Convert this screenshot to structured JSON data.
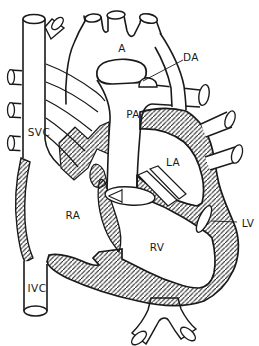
{
  "figure": {
    "background_color": "#ffffff",
    "line_color": "#1a1a1a",
    "labels": {
      "aorta": "A",
      "ductus_arteriosus": "DA",
      "pulmonary_artery": "PA",
      "superior_vena_cava": "SVC",
      "left_atrium": "LA",
      "right_atrium": "RA",
      "left_ventricle": "LV",
      "right_ventricle": "RV",
      "inferior_vena_cava": "IVC"
    }
  }
}
